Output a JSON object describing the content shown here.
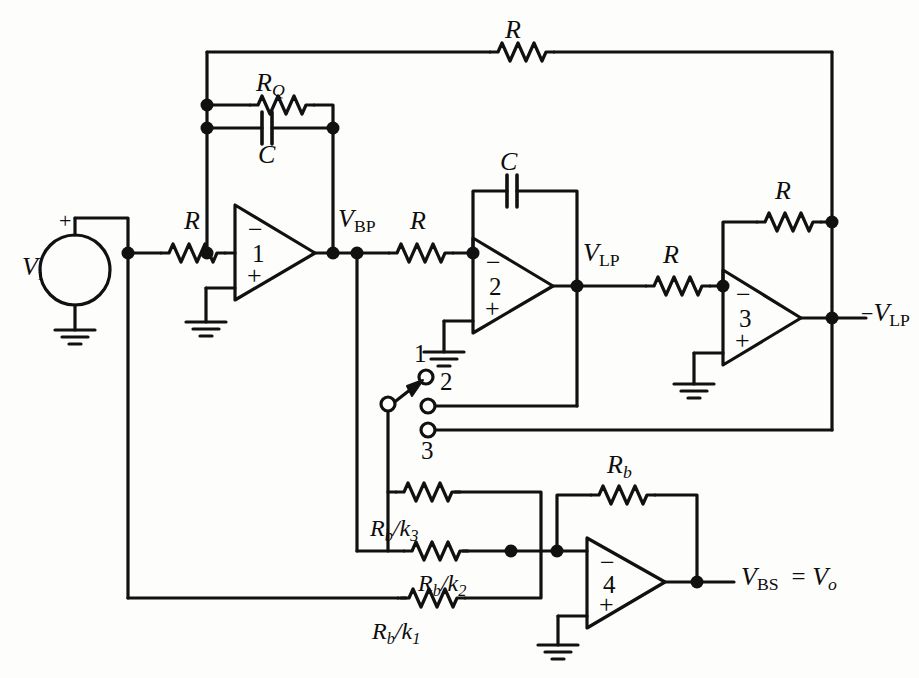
{
  "figure": {
    "kind": "circuit-schematic",
    "stroke_color": "#111111",
    "background_color": "#fdfdfb",
    "node_dot_color": "#111111"
  },
  "source": {
    "name": "input-voltage-source",
    "label": "V",
    "label_sub": "i",
    "polarity": "+"
  },
  "opamps": [
    {
      "id": "1",
      "name": "opamp-1",
      "minus": "−",
      "plus": "+",
      "number": "1"
    },
    {
      "id": "2",
      "name": "opamp-2",
      "minus": "−",
      "plus": "+",
      "number": "2"
    },
    {
      "id": "3",
      "name": "opamp-3",
      "minus": "−",
      "plus": "+",
      "number": "3"
    },
    {
      "id": "4",
      "name": "opamp-4",
      "minus": "−",
      "plus": "+",
      "number": "4"
    }
  ],
  "components": {
    "r_top_feedback": "R",
    "r_q": {
      "base": "R",
      "sub": "Q"
    },
    "c_q": "C",
    "r_input": "R",
    "r_bp_to_2": "R",
    "c_integrator": "C",
    "r_lp_to_3": "R",
    "r_inverter_feedback": "R",
    "r_b_feedback": {
      "base": "R",
      "sub": "b"
    },
    "r_b_k3": {
      "base": "R",
      "sub_b": "b",
      "div": "/",
      "k": "k",
      "sub_k": "3"
    },
    "r_b_k2": {
      "base": "R",
      "sub_b": "b",
      "div": "/",
      "k": "k",
      "sub_k": "2"
    },
    "r_b_k1": {
      "base": "R",
      "sub_b": "b",
      "div": "/",
      "k": "k",
      "sub_k": "1"
    }
  },
  "nodes": {
    "v_bp": {
      "base": "V",
      "sub": "BP"
    },
    "v_lp": {
      "base": "V",
      "sub": "LP"
    },
    "v_lp_neg": {
      "prefix": "−",
      "base": "V",
      "sub": "LP"
    },
    "v_out": {
      "base": "V",
      "sub": "BS",
      "eq": "=",
      "base2": "V",
      "sub2": "o"
    }
  },
  "switch": {
    "name": "mode-selector-switch",
    "selected": "1",
    "terminals": [
      {
        "id": "1",
        "label": "1",
        "connects_to": "open"
      },
      {
        "id": "2",
        "label": "2",
        "connects_to": "V_LP"
      },
      {
        "id": "3",
        "label": "3",
        "connects_to": "-V_LP"
      }
    ]
  },
  "ground_symbols": 5
}
